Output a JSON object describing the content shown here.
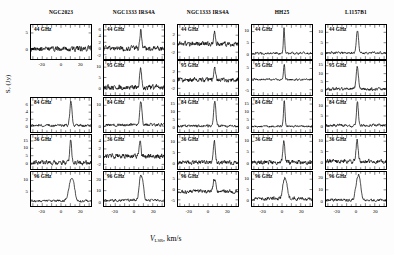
{
  "figure": {
    "ylabel_main": "S",
    "ylabel_sub": "ν",
    "ylabel_unit": "(Jy)",
    "xlabel_main": "V",
    "xlabel_sub": "LSR",
    "xlabel_unit": ", km/s",
    "background": "#ffffff",
    "trace_color": "#000000"
  },
  "columns": [
    {
      "title": "NGC2023"
    },
    {
      "title": "NGC1333 IRS4A"
    },
    {
      "title": "NGC1333 IRS4A"
    },
    {
      "title": "HH25"
    },
    {
      "title": "L1157B1"
    }
  ],
  "rows": [
    {
      "label": "44 GHz"
    },
    {
      "label": "95 GHz"
    },
    {
      "label": "84 GHz"
    },
    {
      "label": "36 GHz"
    },
    {
      "label": "96 GHz"
    }
  ],
  "xaxis": {
    "ticks": [
      -20,
      0,
      20
    ],
    "min": -32,
    "max": 32
  },
  "chart_data": {
    "type": "line",
    "xlabel": "V_LSR, km/s",
    "ylabel": "S_nu (Jy)",
    "grid": false,
    "legend": "none",
    "xlim": [
      -32,
      32
    ],
    "xticks": [
      -20,
      0,
      20
    ],
    "panel_grid": {
      "rows": 5,
      "cols": 5
    },
    "row_frequencies": [
      "44 GHz",
      "95 GHz",
      "84 GHz",
      "36 GHz",
      "96 GHz"
    ],
    "column_sources": [
      "NGC2023",
      "NGC1333 IRS4A",
      "NGC1333 IRS4A",
      "HH25",
      "L1157B1"
    ],
    "panels": [
      {
        "col": 0,
        "row": 0,
        "source": "NGC2023",
        "freq": "44 GHz",
        "present": true,
        "yticks": [
          0,
          5
        ],
        "ylim": [
          -3.2,
          7.5
        ],
        "noise": 0.85,
        "peak": 0.0,
        "peak_v": 10.5,
        "peak_width": 1.1,
        "baseline": 0.0,
        "seed": 11
      },
      {
        "col": 0,
        "row": 1,
        "source": "NGC2023",
        "freq": "95 GHz",
        "present": false,
        "yticks": [],
        "ylim": [
          0,
          1
        ],
        "noise": 0,
        "peak": 0,
        "peak_v": 0,
        "peak_width": 1,
        "baseline": 0,
        "seed": 0
      },
      {
        "col": 0,
        "row": 2,
        "source": "NGC2023",
        "freq": "84 GHz",
        "present": true,
        "yticks": [
          0,
          2,
          4,
          6
        ],
        "ylim": [
          -1.6,
          8.0
        ],
        "noise": 0.38,
        "peak": 6.6,
        "peak_v": 10.6,
        "peak_width": 1.2,
        "baseline": 0.25,
        "seed": 23
      },
      {
        "col": 0,
        "row": 3,
        "source": "NGC2023",
        "freq": "36 GHz",
        "present": true,
        "yticks": [
          0,
          5,
          10,
          15
        ],
        "ylim": [
          -4.0,
          19.0
        ],
        "noise": 1.5,
        "peak": 16.5,
        "peak_v": 10.4,
        "peak_width": 0.95,
        "baseline": 0.3,
        "seed": 37
      },
      {
        "col": 0,
        "row": 4,
        "source": "NGC2023",
        "freq": "96 GHz",
        "present": true,
        "yticks": [
          5,
          10
        ],
        "ylim": [
          -2.0,
          14.0
        ],
        "noise": 0.55,
        "peak": 9.0,
        "peak_v": 10.7,
        "peak_width": 2.6,
        "baseline": 0.4,
        "seed": 47
      },
      {
        "col": 1,
        "row": 0,
        "source": "NGC1333 IRS4A",
        "freq": "44 GHz",
        "present": true,
        "yticks": [
          -2,
          0,
          2,
          4,
          6
        ],
        "ylim": [
          -3.4,
          7.6
        ],
        "noise": 0.85,
        "peak": 6.0,
        "peak_v": 7.2,
        "peak_width": 1.0,
        "baseline": 0.0,
        "seed": 53
      },
      {
        "col": 1,
        "row": 1,
        "source": "NGC1333 IRS4A",
        "freq": "95 GHz",
        "present": true,
        "yticks": [
          0,
          5,
          10
        ],
        "ylim": [
          -3.5,
          13.0
        ],
        "noise": 1.3,
        "peak": 10.5,
        "peak_v": 7.0,
        "peak_width": 1.0,
        "baseline": 0.2,
        "seed": 61
      },
      {
        "col": 1,
        "row": 2,
        "source": "NGC1333 IRS4A",
        "freq": "84 GHz",
        "present": true,
        "yticks": [
          0,
          5,
          10
        ],
        "ylim": [
          -2.8,
          13.5
        ],
        "noise": 0.75,
        "peak": 11.5,
        "peak_v": 7.3,
        "peak_width": 1.1,
        "baseline": 0.6,
        "seed": 71
      },
      {
        "col": 1,
        "row": 3,
        "source": "NGC1333 IRS4A",
        "freq": "36 GHz",
        "present": true,
        "yticks": [
          -2,
          0,
          2,
          4
        ],
        "ylim": [
          -3.2,
          5.6
        ],
        "noise": 0.62,
        "peak": 4.3,
        "peak_v": 6.4,
        "peak_width": 0.9,
        "baseline": 0.1,
        "seed": 83
      },
      {
        "col": 1,
        "row": 4,
        "source": "NGC1333 IRS4A",
        "freq": "96 GHz",
        "present": true,
        "yticks": [
          0,
          10,
          20
        ],
        "ylim": [
          -4.0,
          27.0
        ],
        "noise": 1.1,
        "peak": 22.0,
        "peak_v": 7.1,
        "peak_width": 1.6,
        "baseline": 1.2,
        "seed": 97
      },
      {
        "col": 2,
        "row": 0,
        "source": "NGC1333 IRS4A",
        "freq": "44 GHz",
        "present": true,
        "yticks": [
          -2,
          0,
          2
        ],
        "ylim": [
          -3.6,
          4.4
        ],
        "noise": 0.6,
        "peak": 3.0,
        "peak_v": 7.0,
        "peak_width": 0.9,
        "baseline": 0.0,
        "seed": 103
      },
      {
        "col": 2,
        "row": 1,
        "source": "NGC1333 IRS4A",
        "freq": "95 GHz",
        "present": true,
        "yticks": [
          -2,
          0,
          2
        ],
        "ylim": [
          -3.6,
          4.6
        ],
        "noise": 0.58,
        "peak": 3.2,
        "peak_v": 7.1,
        "peak_width": 1.0,
        "baseline": 0.1,
        "seed": 113
      },
      {
        "col": 2,
        "row": 2,
        "source": "NGC1333 IRS4A",
        "freq": "84 GHz",
        "present": true,
        "yticks": [
          0,
          5,
          10,
          15
        ],
        "ylim": [
          -3.5,
          19.0
        ],
        "noise": 0.9,
        "peak": 16.0,
        "peak_v": 7.2,
        "peak_width": 1.2,
        "baseline": 0.5,
        "seed": 127
      },
      {
        "col": 2,
        "row": 3,
        "source": "NGC1333 IRS4A",
        "freq": "36 GHz",
        "present": true,
        "yticks": [
          0,
          5,
          10
        ],
        "ylim": [
          -3.0,
          13.5
        ],
        "noise": 1.0,
        "peak": 10.8,
        "peak_v": 6.8,
        "peak_width": 1.0,
        "baseline": 0.2,
        "seed": 139
      },
      {
        "col": 2,
        "row": 4,
        "source": "NGC1333 IRS4A",
        "freq": "96 GHz",
        "present": true,
        "yticks": [
          -5,
          0,
          5
        ],
        "ylim": [
          -8.0,
          8.5
        ],
        "noise": 1.0,
        "peak": 5.5,
        "peak_v": 7.0,
        "peak_width": 1.4,
        "baseline": -1.0,
        "seed": 149
      },
      {
        "col": 3,
        "row": 0,
        "source": "HH25",
        "freq": "44 GHz",
        "present": true,
        "yticks": [
          0,
          5,
          10
        ],
        "ylim": [
          -2.5,
          13.0
        ],
        "noise": 0.52,
        "peak": 11.5,
        "peak_v": 2.2,
        "peak_width": 0.7,
        "baseline": 0.1,
        "seed": 157
      },
      {
        "col": 3,
        "row": 1,
        "source": "HH25",
        "freq": "95 GHz",
        "present": true,
        "yticks": [
          -5,
          0,
          5
        ],
        "ylim": [
          -7.5,
          8.5
        ],
        "noise": 0.5,
        "peak": 7.4,
        "peak_v": 2.3,
        "peak_width": 0.7,
        "baseline": -0.2,
        "seed": 167
      },
      {
        "col": 3,
        "row": 2,
        "source": "HH25",
        "freq": "84 GHz",
        "present": true,
        "yticks": [
          0,
          5,
          10,
          15
        ],
        "ylim": [
          -3.5,
          19.0
        ],
        "noise": 0.7,
        "peak": 16.5,
        "peak_v": 2.4,
        "peak_width": 0.8,
        "baseline": 0.3,
        "seed": 179
      },
      {
        "col": 3,
        "row": 3,
        "source": "HH25",
        "freq": "36 GHz",
        "present": true,
        "yticks": [
          0,
          5,
          10
        ],
        "ylim": [
          -3.0,
          13.0
        ],
        "noise": 1.05,
        "peak": 10.0,
        "peak_v": 1.9,
        "peak_width": 1.0,
        "baseline": 0.2,
        "seed": 191
      },
      {
        "col": 3,
        "row": 4,
        "source": "HH25",
        "freq": "96 GHz",
        "present": true,
        "yticks": [
          0,
          5,
          10
        ],
        "ylim": [
          -3.0,
          13.5
        ],
        "noise": 0.9,
        "peak": 9.5,
        "peak_v": 2.6,
        "peak_width": 1.8,
        "baseline": 0.6,
        "seed": 199
      },
      {
        "col": 4,
        "row": 0,
        "source": "L1157B1",
        "freq": "44 GHz",
        "present": true,
        "yticks": [
          0,
          5,
          10
        ],
        "ylim": [
          -2.8,
          13.5
        ],
        "noise": 0.62,
        "peak": 11.0,
        "peak_v": 1.6,
        "peak_width": 1.1,
        "baseline": 0.2,
        "seed": 211
      },
      {
        "col": 4,
        "row": 1,
        "source": "L1157B1",
        "freq": "95 GHz",
        "present": true,
        "yticks": [
          0,
          5,
          10,
          15
        ],
        "ylim": [
          -3.5,
          18.0
        ],
        "noise": 1.0,
        "peak": 14.5,
        "peak_v": 1.4,
        "peak_width": 1.2,
        "baseline": 0.3,
        "seed": 223
      },
      {
        "col": 4,
        "row": 2,
        "source": "L1157B1",
        "freq": "84 GHz",
        "present": true,
        "yticks": [
          0,
          5,
          10
        ],
        "ylim": [
          -3.0,
          14.0
        ],
        "noise": 0.72,
        "peak": 12.0,
        "peak_v": 1.5,
        "peak_width": 1.0,
        "baseline": 0.3,
        "seed": 233
      },
      {
        "col": 4,
        "row": 3,
        "source": "L1157B1",
        "freq": "36 GHz",
        "present": true,
        "yticks": [
          0,
          5,
          10
        ],
        "ylim": [
          -3.5,
          13.0
        ],
        "noise": 1.1,
        "peak": 10.5,
        "peak_v": 1.2,
        "peak_width": 1.1,
        "baseline": 0.2,
        "seed": 241
      },
      {
        "col": 4,
        "row": 4,
        "source": "L1157B1",
        "freq": "96 GHz",
        "present": true,
        "yticks": [
          0,
          10,
          20
        ],
        "ylim": [
          -4.5,
          26.0
        ],
        "noise": 1.2,
        "peak": 20.0,
        "peak_v": 1.8,
        "peak_width": 2.0,
        "baseline": 0.8,
        "seed": 251
      }
    ]
  }
}
